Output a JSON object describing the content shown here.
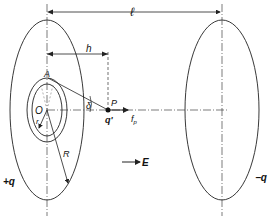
{
  "diagram": {
    "labels": {
      "distance_l": "ℓ",
      "distance_h": "h",
      "point_A": "A",
      "point_O": "O",
      "radius_r": "r",
      "angle_delta": "δ",
      "point_P": "P",
      "test_charge": "q'",
      "force": "f",
      "force_sub": "p",
      "radius_R": "R",
      "field": "E",
      "plus_charge": "+q",
      "minus_charge": "−q"
    },
    "colors": {
      "stroke": "#222222",
      "background": "#ffffff"
    }
  }
}
